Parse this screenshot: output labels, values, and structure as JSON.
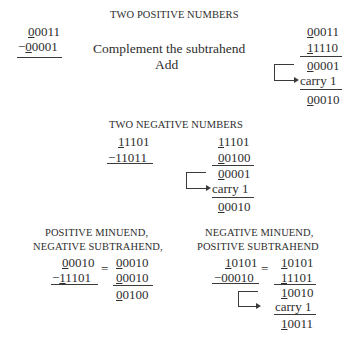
{
  "sections": {
    "two_positive": {
      "title": "TWO POSITIVE NUMBERS",
      "problem": {
        "minuend_sign": "0",
        "minuend_rest": "0011",
        "minus": "−",
        "subtrahend_sign": "0",
        "subtrahend_rest": "0001"
      },
      "steps": [
        "Complement the subtrahend",
        "Add"
      ],
      "work": [
        {
          "sign": "0",
          "rest": "0011"
        },
        {
          "sign": "1",
          "rest": "1110"
        },
        {
          "sign": "0",
          "rest": "0001"
        },
        {
          "carry": "carry 1"
        },
        {
          "sign": "0",
          "rest": "0010"
        }
      ]
    },
    "two_negative": {
      "title": "TWO NEGATIVE NUMBERS",
      "problem": {
        "minuend_sign": "1",
        "minuend_rest": "1101",
        "minus": "−",
        "subtrahend_sign": "1",
        "subtrahend_rest": "1011"
      },
      "work": [
        {
          "sign": "1",
          "rest": "1101"
        },
        {
          "sign": "0",
          "rest": "0100"
        },
        {
          "sign": "0",
          "rest": "0001"
        },
        {
          "carry": "carry 1"
        },
        {
          "sign": "0",
          "rest": "0010"
        }
      ]
    },
    "pos_minuend_neg_subtrahend": {
      "title_line1": "POSITIVE MINUEND,",
      "title_line2": "NEGATIVE SUBTRAHEND,",
      "problem": {
        "minuend_sign": "0",
        "minuend_rest": "0010",
        "minus": "−",
        "subtrahend_sign": "1",
        "subtrahend_rest": "1101"
      },
      "equals": "=",
      "work": [
        {
          "sign": "0",
          "rest": "0010"
        },
        {
          "sign": "0",
          "rest": "0010"
        },
        {
          "sign": "0",
          "rest": "0100"
        }
      ]
    },
    "neg_minuend_pos_subtrahend": {
      "title_line1": "NEGATIVE MINUEND,",
      "title_line2": "POSITIVE SUBTRAHEND",
      "problem": {
        "minuend_sign": "1",
        "minuend_rest": "0101",
        "minus": "−",
        "subtrahend_sign": "0",
        "subtrahend_rest": "0010"
      },
      "equals": "=",
      "work": [
        {
          "sign": "1",
          "rest": "0101"
        },
        {
          "sign": "1",
          "rest": "1101"
        },
        {
          "sign": "1",
          "rest": "0010"
        },
        {
          "carry": "carry 1"
        },
        {
          "sign": "1",
          "rest": "0011"
        }
      ]
    }
  }
}
